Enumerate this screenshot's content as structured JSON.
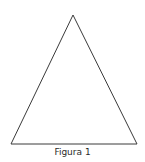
{
  "figure": {
    "shape": "triangle",
    "vertices": {
      "apex": [
        73,
        15
      ],
      "bottom_left": [
        11,
        144
      ],
      "bottom_right": [
        137,
        144
      ]
    },
    "stroke_color": "#3a3a3a",
    "caption": "Figura 1"
  }
}
